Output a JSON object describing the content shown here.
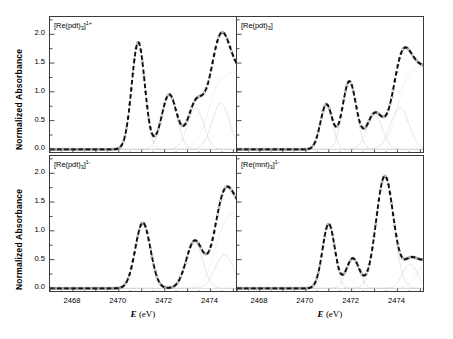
{
  "figure": {
    "axis_labels": {
      "y": "Normalized Absorbance",
      "x_italic": "E",
      "x_unit": " (eV)"
    },
    "y_ticks": [
      "0.0",
      "0.5",
      "1.0",
      "1.5",
      "2.0"
    ],
    "x_ticks": [
      "2468",
      "2470",
      "2472",
      "2474"
    ]
  },
  "chart_data": [
    {
      "type": "line",
      "panel": "top-left",
      "title": "[Re(pdt)3]1+",
      "label_base": "[Re(pdt)",
      "label_sub": "3",
      "label_close": "]",
      "label_sup": "1+",
      "xlabel": "E (eV)",
      "ylabel": "Normalized Absorbance",
      "xlim": [
        2467.0,
        2475.2
      ],
      "ylim": [
        -0.08,
        2.3
      ],
      "grid": false,
      "legend": null,
      "series": [
        {
          "name": "data",
          "style": "open-circles",
          "color": "#555555"
        },
        {
          "name": "fit",
          "style": "dashed",
          "color": "#111111"
        },
        {
          "name": "components",
          "style": "dotted",
          "color": "#c8c8c8"
        }
      ],
      "edge_step": {
        "center": 2473.9,
        "width": 1.05,
        "height": 1.35
      },
      "components": [
        {
          "center": 2470.85,
          "sigma": 0.285,
          "amplitude": 1.86
        },
        {
          "center": 2472.2,
          "sigma": 0.33,
          "amplitude": 0.95
        },
        {
          "center": 2473.35,
          "sigma": 0.35,
          "amplitude": 0.72
        },
        {
          "center": 2474.45,
          "sigma": 0.38,
          "amplitude": 0.8
        }
      ],
      "peaks": [
        {
          "energy": 2470.85,
          "intensity": 1.9
        },
        {
          "energy": 2472.25,
          "intensity": 1.25
        },
        {
          "energy": 2474.6,
          "intensity": 1.62
        }
      ],
      "minima": [
        {
          "energy": 2473.15,
          "intensity": 0.83
        }
      ]
    },
    {
      "type": "line",
      "panel": "top-right",
      "title": "[Re(pdt)3]",
      "label_base": "[Re(pdt)",
      "label_sub": "3",
      "label_close": "]",
      "label_sup": "",
      "xlabel": "E (eV)",
      "ylabel": "Normalized Absorbance",
      "xlim": [
        2467.0,
        2475.2
      ],
      "ylim": [
        -0.08,
        2.3
      ],
      "grid": false,
      "legend": null,
      "series": [
        {
          "name": "data",
          "style": "open-circles",
          "color": "#555555"
        },
        {
          "name": "fit",
          "style": "dashed",
          "color": "#111111"
        },
        {
          "name": "components",
          "style": "dotted",
          "color": "#c8c8c8"
        }
      ],
      "edge_step": {
        "center": 2474.0,
        "width": 1.0,
        "height": 1.45
      },
      "components": [
        {
          "center": 2470.9,
          "sigma": 0.26,
          "amplitude": 0.78
        },
        {
          "center": 2471.9,
          "sigma": 0.3,
          "amplitude": 1.18
        },
        {
          "center": 2473.0,
          "sigma": 0.34,
          "amplitude": 0.6
        },
        {
          "center": 2474.1,
          "sigma": 0.4,
          "amplitude": 0.72
        }
      ],
      "peaks": [
        {
          "energy": 2470.95,
          "intensity": 1.05
        },
        {
          "energy": 2471.95,
          "intensity": 1.45
        },
        {
          "energy": 2474.4,
          "intensity": 1.7
        }
      ],
      "minima": [
        {
          "energy": 2471.45,
          "intensity": 0.9
        },
        {
          "energy": 2473.0,
          "intensity": 1.05
        }
      ]
    },
    {
      "type": "line",
      "panel": "bottom-left",
      "title": "[Re(pdt)3]1-",
      "label_base": "[Re(pdt)",
      "label_sub": "3",
      "label_close": "]",
      "label_sup": "1-",
      "xlabel": "E (eV)",
      "ylabel": "Normalized Absorbance",
      "xlim": [
        2467.0,
        2475.2
      ],
      "ylim": [
        -0.08,
        2.3
      ],
      "grid": false,
      "legend": null,
      "series": [
        {
          "name": "data",
          "style": "open-circles",
          "color": "#555555"
        },
        {
          "name": "fit",
          "style": "dashed",
          "color": "#111111"
        },
        {
          "name": "components",
          "style": "dotted",
          "color": "#c8c8c8"
        }
      ],
      "edge_step": {
        "center": 2474.2,
        "width": 1.0,
        "height": 1.35
      },
      "components": [
        {
          "center": 2471.05,
          "sigma": 0.33,
          "amplitude": 1.14
        },
        {
          "center": 2473.3,
          "sigma": 0.36,
          "amplitude": 0.8
        },
        {
          "center": 2474.6,
          "sigma": 0.4,
          "amplitude": 0.58
        }
      ],
      "peaks": [
        {
          "energy": 2471.05,
          "intensity": 1.2
        },
        {
          "energy": 2474.3,
          "intensity": 1.52
        }
      ],
      "minima": [
        {
          "energy": 2472.1,
          "intensity": 0.58
        }
      ]
    },
    {
      "type": "line",
      "panel": "bottom-right",
      "title": "[Re(mnt)3]1-",
      "label_base": "[Re(mnt)",
      "label_sub": "3",
      "label_close": "]",
      "label_sup": "1-",
      "xlabel": "E (eV)",
      "ylabel": "Normalized Absorbance",
      "xlim": [
        2467.0,
        2475.2
      ],
      "ylim": [
        -0.08,
        2.3
      ],
      "grid": false,
      "legend": null,
      "series": [
        {
          "name": "data",
          "style": "open-circles",
          "color": "#555555"
        },
        {
          "name": "fit",
          "style": "dashed",
          "color": "#111111"
        },
        {
          "name": "components",
          "style": "dotted",
          "color": "#c8c8c8"
        }
      ],
      "edge_step": {
        "center": 2474.9,
        "width": 0.9,
        "height": 0.55
      },
      "components": [
        {
          "center": 2471.0,
          "sigma": 0.27,
          "amplitude": 1.12
        },
        {
          "center": 2472.05,
          "sigma": 0.28,
          "amplitude": 0.52
        },
        {
          "center": 2473.45,
          "sigma": 0.38,
          "amplitude": 1.95
        },
        {
          "center": 2474.55,
          "sigma": 0.33,
          "amplitude": 0.42
        }
      ],
      "peaks": [
        {
          "energy": 2471.0,
          "intensity": 1.2
        },
        {
          "energy": 2473.5,
          "intensity": 2.15
        }
      ],
      "minima": [
        {
          "energy": 2471.7,
          "intensity": 0.83
        },
        {
          "energy": 2472.5,
          "intensity": 0.92
        }
      ]
    }
  ]
}
